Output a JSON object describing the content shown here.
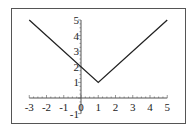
{
  "chart_data": {
    "type": "line",
    "title": "",
    "xlabel": "",
    "ylabel": "",
    "xlim": [
      -3,
      5
    ],
    "ylim": [
      -1,
      5
    ],
    "grid": false,
    "legend": null,
    "x_ticks": [
      "-3",
      "-2",
      "-1",
      "0",
      "1",
      "2",
      "3",
      "4",
      "5"
    ],
    "y_ticks": [
      "-1",
      "1",
      "2",
      "3",
      "4",
      "5"
    ],
    "series": [
      {
        "name": "y = |x - 1| + 1",
        "x": [
          -3,
          1,
          5
        ],
        "y": [
          5,
          1,
          5
        ]
      }
    ],
    "colors": {
      "line": "#222222",
      "axis": "#555555",
      "frame": "#555555"
    }
  }
}
